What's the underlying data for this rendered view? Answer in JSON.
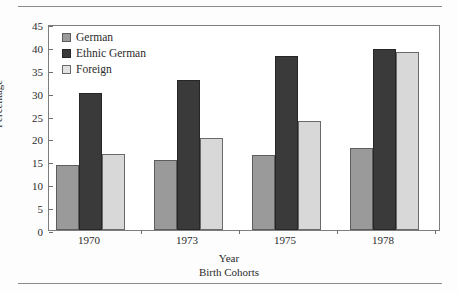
{
  "chart_data": {
    "type": "bar",
    "title": "",
    "subtitle": "",
    "xlabel": "Year",
    "xlabel_secondary": "Birth Cohorts",
    "ylabel": "Percentage",
    "categories": [
      "1970",
      "1973",
      "1975",
      "1978"
    ],
    "series": [
      {
        "name": "German",
        "color": "#9a9a9a",
        "values": [
          14.1,
          15.4,
          16.4,
          17.9
        ]
      },
      {
        "name": "Ethnic German",
        "color": "#3a3a3a",
        "values": [
          30.0,
          32.8,
          38.0,
          39.6
        ]
      },
      {
        "name": "Foreign",
        "color": "#d8d8d8",
        "values": [
          16.6,
          20.0,
          23.8,
          38.8
        ]
      }
    ],
    "ylim": [
      0,
      45
    ],
    "yticks": [
      0,
      5,
      10,
      15,
      20,
      25,
      30,
      35,
      40,
      45
    ],
    "ytick_labels": [
      "0",
      "5",
      "10",
      "15",
      "20",
      "25",
      "30",
      "35",
      "40",
      "45"
    ],
    "grid": false,
    "legend_position": "top-left",
    "legend_entries": [
      "German",
      "Ethnic German",
      "Foreign"
    ],
    "frame": true,
    "annotations": []
  },
  "figure": {
    "background": "#fdfdfd",
    "rule_color": "#8a8a8a",
    "axis_color": "#7d7d7d"
  }
}
